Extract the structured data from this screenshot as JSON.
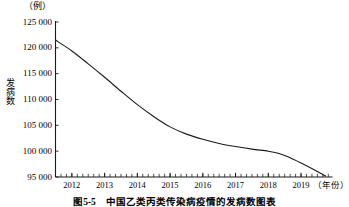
{
  "figure": {
    "caption": "图5-5　中国乙类丙类传染病疫情的发病数图表",
    "unit_label": "（例）",
    "y_axis_title": "发病数",
    "x_axis_title": "（年份）"
  },
  "chart_data": {
    "type": "line",
    "title": "",
    "subtitle": "",
    "xlabel": "（年份）",
    "ylabel": "发病数",
    "unit": "（例）",
    "xlim": [
      2011.5,
      2019.9
    ],
    "ylim": [
      95000,
      125000
    ],
    "grid": false,
    "legend": null,
    "y_ticks": [
      125000,
      120000,
      115000,
      110000,
      105000,
      100000,
      95000
    ],
    "y_tick_labels": [
      "125 000",
      "120 000",
      "115 000",
      "110 000",
      "105 000",
      "100 000",
      "95 000"
    ],
    "x_ticks": [
      2012,
      2013,
      2014,
      2015,
      2016,
      2017,
      2018,
      2019
    ],
    "x_tick_labels": [
      "2012",
      "2013",
      "2014",
      "2015",
      "2016",
      "2017",
      "2018",
      "2019"
    ],
    "minor_ticks": true,
    "series": [
      {
        "name": "发病数",
        "color": "#1a1a1a",
        "x": [
          2011.5,
          2012.0,
          2012.5,
          2013.0,
          2013.5,
          2014.0,
          2014.5,
          2015.0,
          2015.5,
          2016.0,
          2016.5,
          2017.0,
          2017.5,
          2018.0,
          2018.3,
          2018.6,
          2019.0,
          2019.4,
          2019.75
        ],
        "values": [
          121500,
          119400,
          116900,
          114300,
          111600,
          109000,
          106700,
          104700,
          103300,
          102300,
          101500,
          100900,
          100400,
          100000,
          99600,
          98900,
          97700,
          96400,
          95200
        ]
      }
    ]
  }
}
